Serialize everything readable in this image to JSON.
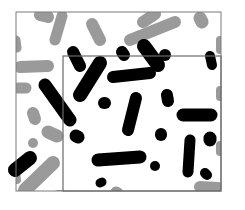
{
  "image": {
    "width": 245,
    "height": 210,
    "background": "#ffffff",
    "outer_frame": {
      "x": 16,
      "y": 12,
      "w": 205,
      "h": 179,
      "stroke": "#7a7a7a"
    },
    "inner_frame": {
      "x": 63,
      "y": 56,
      "w": 158,
      "h": 135,
      "stroke": "#6a6a6a"
    },
    "colors": {
      "outside": "#9a9a9a",
      "inside": "#000000"
    }
  },
  "grey_blobs": [
    {
      "x1": 40,
      "y1": 15,
      "x2": 48,
      "y2": 17,
      "w": 12
    },
    {
      "x1": 62,
      "y1": 16,
      "x2": 55,
      "y2": 40,
      "w": 11
    },
    {
      "x1": 92,
      "y1": 24,
      "x2": 100,
      "y2": 40,
      "w": 12
    },
    {
      "x1": 143,
      "y1": 22,
      "x2": 155,
      "y2": 14,
      "w": 12
    },
    {
      "x1": 130,
      "y1": 40,
      "x2": 175,
      "y2": 22,
      "w": 12
    },
    {
      "x1": 200,
      "y1": 18,
      "x2": 202,
      "y2": 22,
      "w": 13
    },
    {
      "x1": 16,
      "y1": 40,
      "x2": 17,
      "y2": 48,
      "w": 9
    },
    {
      "x1": 20,
      "y1": 67,
      "x2": 48,
      "y2": 66,
      "w": 12
    },
    {
      "x1": 18,
      "y1": 88,
      "x2": 26,
      "y2": 88,
      "w": 11
    },
    {
      "x1": 33,
      "y1": 113,
      "x2": 35,
      "y2": 119,
      "w": 12
    },
    {
      "x1": 48,
      "y1": 132,
      "x2": 57,
      "y2": 136,
      "w": 13
    },
    {
      "x1": 33,
      "y1": 143,
      "x2": 33,
      "y2": 143,
      "w": 10
    },
    {
      "x1": 53,
      "y1": 163,
      "x2": 25,
      "y2": 190,
      "w": 14
    },
    {
      "x1": 16,
      "y1": 172,
      "x2": 17,
      "y2": 180,
      "w": 8
    },
    {
      "x1": 58,
      "y1": 194,
      "x2": 62,
      "y2": 194,
      "w": 8
    },
    {
      "x1": 116,
      "y1": 192,
      "x2": 118,
      "y2": 193,
      "w": 11
    },
    {
      "x1": 200,
      "y1": 187,
      "x2": 218,
      "y2": 188,
      "w": 12
    },
    {
      "x1": 220,
      "y1": 145,
      "x2": 220,
      "y2": 152,
      "w": 8
    },
    {
      "x1": 220,
      "y1": 40,
      "x2": 220,
      "y2": 50,
      "w": 8
    },
    {
      "x1": 220,
      "y1": 90,
      "x2": 220,
      "y2": 97,
      "w": 8
    }
  ],
  "black_blobs": [
    {
      "x1": 73,
      "y1": 52,
      "x2": 80,
      "y2": 66,
      "w": 12
    },
    {
      "x1": 100,
      "y1": 63,
      "x2": 80,
      "y2": 95,
      "w": 14
    },
    {
      "x1": 122,
      "y1": 52,
      "x2": 124,
      "y2": 55,
      "w": 12
    },
    {
      "x1": 144,
      "y1": 46,
      "x2": 158,
      "y2": 65,
      "w": 14
    },
    {
      "x1": 45,
      "y1": 85,
      "x2": 70,
      "y2": 120,
      "w": 13
    },
    {
      "x1": 113,
      "y1": 77,
      "x2": 150,
      "y2": 73,
      "w": 12
    },
    {
      "x1": 165,
      "y1": 55,
      "x2": 165,
      "y2": 55,
      "w": 12
    },
    {
      "x1": 210,
      "y1": 56,
      "x2": 212,
      "y2": 65,
      "w": 10
    },
    {
      "x1": 136,
      "y1": 98,
      "x2": 128,
      "y2": 130,
      "w": 12
    },
    {
      "x1": 104,
      "y1": 103,
      "x2": 105,
      "y2": 103,
      "w": 12
    },
    {
      "x1": 167,
      "y1": 95,
      "x2": 168,
      "y2": 101,
      "w": 12
    },
    {
      "x1": 183,
      "y1": 115,
      "x2": 211,
      "y2": 115,
      "w": 13
    },
    {
      "x1": 161,
      "y1": 134,
      "x2": 161,
      "y2": 135,
      "w": 12
    },
    {
      "x1": 190,
      "y1": 140,
      "x2": 188,
      "y2": 172,
      "w": 11
    },
    {
      "x1": 210,
      "y1": 138,
      "x2": 210,
      "y2": 140,
      "w": 13
    },
    {
      "x1": 76,
      "y1": 136,
      "x2": 78,
      "y2": 137,
      "w": 13
    },
    {
      "x1": 98,
      "y1": 160,
      "x2": 140,
      "y2": 157,
      "w": 13
    },
    {
      "x1": 155,
      "y1": 166,
      "x2": 155,
      "y2": 166,
      "w": 10
    },
    {
      "x1": 205,
      "y1": 173,
      "x2": 207,
      "y2": 175,
      "w": 10
    },
    {
      "x1": 30,
      "y1": 158,
      "x2": 15,
      "y2": 170,
      "w": 14
    },
    {
      "x1": 100,
      "y1": 183,
      "x2": 102,
      "y2": 182,
      "w": 9
    }
  ]
}
